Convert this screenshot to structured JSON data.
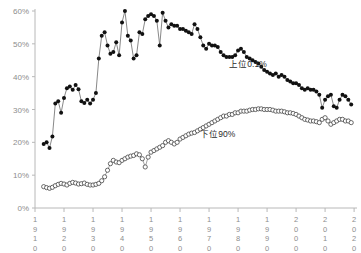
{
  "chart_data": {
    "type": "line",
    "title": "",
    "subtitle": "",
    "xlabel": "",
    "ylabel": "",
    "xlim": [
      1910,
      2021
    ],
    "ylim": [
      0,
      60
    ],
    "grid": false,
    "legend_position": "inline-annotations",
    "y_tick_labels": [
      "0%",
      "10%",
      "20%",
      "30%",
      "40%",
      "50%",
      "60%"
    ],
    "y_tick_values": [
      0,
      10,
      20,
      30,
      40,
      50,
      60
    ],
    "x_tick_labels": [
      "1910",
      "1920",
      "1930",
      "1940",
      "1950",
      "1960",
      "1970",
      "1980",
      "1990",
      "2000",
      "2010",
      "2020"
    ],
    "x_tick_values": [
      1910,
      1920,
      1930,
      1940,
      1950,
      1960,
      1970,
      1980,
      1990,
      2000,
      2010,
      2020
    ],
    "annotations": [
      {
        "name": "top-series-label",
        "text": "上位0.1%",
        "x": 1977,
        "y": 43
      },
      {
        "name": "bottom-series-label",
        "text": "下位90%",
        "x": 1967,
        "y": 21.5
      }
    ],
    "series": [
      {
        "name": "上位0.1%",
        "marker": "filled-circle",
        "color": "#111111",
        "x": [
          1913,
          1914,
          1915,
          1916,
          1917,
          1918,
          1919,
          1920,
          1921,
          1922,
          1923,
          1924,
          1925,
          1926,
          1927,
          1928,
          1929,
          1930,
          1931,
          1932,
          1933,
          1934,
          1935,
          1936,
          1937,
          1938,
          1939,
          1940,
          1941,
          1942,
          1943,
          1944,
          1945,
          1946,
          1947,
          1948,
          1949,
          1950,
          1951,
          1952,
          1953,
          1954,
          1955,
          1956,
          1957,
          1958,
          1959,
          1960,
          1961,
          1962,
          1963,
          1964,
          1965,
          1966,
          1967,
          1968,
          1969,
          1970,
          1971,
          1972,
          1973,
          1974,
          1975,
          1976,
          1977,
          1978,
          1979,
          1980,
          1981,
          1982,
          1983,
          1984,
          1985,
          1986,
          1987,
          1988,
          1989,
          1990,
          1991,
          1992,
          1993,
          1994,
          1995,
          1996,
          1997,
          1998,
          1999,
          2000,
          2001,
          2002,
          2003,
          2004,
          2005,
          2006,
          2007,
          2008,
          2009,
          2010,
          2011,
          2012,
          2013,
          2014,
          2015,
          2016,
          2017,
          2018,
          2019
        ],
        "values": [
          19.5,
          20.0,
          18.3,
          21.8,
          31.8,
          32.5,
          29.0,
          33.5,
          36.5,
          37.0,
          36.0,
          37.5,
          36.2,
          32.5,
          32.0,
          33.0,
          31.8,
          33.0,
          35.0,
          45.5,
          52.5,
          53.5,
          49.5,
          47.0,
          47.5,
          50.5,
          46.5,
          56.5,
          60.0,
          52.5,
          51.0,
          45.5,
          46.5,
          53.5,
          53.0,
          57.5,
          58.5,
          59.0,
          58.5,
          57.0,
          49.5,
          59.5,
          57.0,
          55.0,
          56.0,
          55.5,
          55.5,
          54.5,
          54.5,
          54.0,
          53.5,
          53.0,
          56.0,
          54.5,
          52.0,
          49.5,
          48.5,
          50.0,
          49.5,
          49.5,
          49.0,
          47.5,
          46.5,
          46.0,
          46.0,
          46.0,
          46.5,
          48.0,
          48.5,
          47.5,
          46.0,
          45.5,
          45.0,
          44.5,
          44.0,
          43.0,
          42.0,
          41.5,
          41.0,
          40.5,
          41.0,
          40.0,
          40.5,
          40.0,
          39.0,
          38.5,
          38.0,
          38.0,
          37.5,
          36.5,
          36.0,
          36.5,
          36.0,
          36.0,
          35.5,
          34.5,
          30.5,
          33.0,
          34.0,
          34.5,
          31.0,
          30.5,
          33.0,
          34.5,
          34.0,
          33.0,
          31.5
        ]
      },
      {
        "name": "下位90%",
        "marker": "open-circle",
        "color": "#ffffff",
        "x": [
          1913,
          1914,
          1915,
          1916,
          1917,
          1918,
          1919,
          1920,
          1921,
          1922,
          1923,
          1924,
          1925,
          1926,
          1927,
          1928,
          1929,
          1930,
          1931,
          1932,
          1933,
          1934,
          1935,
          1936,
          1937,
          1938,
          1939,
          1940,
          1941,
          1942,
          1943,
          1944,
          1945,
          1946,
          1947,
          1948,
          1949,
          1950,
          1951,
          1952,
          1953,
          1954,
          1955,
          1956,
          1957,
          1958,
          1959,
          1960,
          1961,
          1962,
          1963,
          1964,
          1965,
          1966,
          1967,
          1968,
          1969,
          1970,
          1971,
          1972,
          1973,
          1974,
          1975,
          1976,
          1977,
          1978,
          1979,
          1980,
          1981,
          1982,
          1983,
          1984,
          1985,
          1986,
          1987,
          1988,
          1989,
          1990,
          1991,
          1992,
          1993,
          1994,
          1995,
          1996,
          1997,
          1998,
          1999,
          2000,
          2001,
          2002,
          2003,
          2004,
          2005,
          2006,
          2007,
          2008,
          2009,
          2010,
          2011,
          2012,
          2013,
          2014,
          2015,
          2016,
          2017,
          2018,
          2019
        ],
        "values": [
          6.5,
          6.2,
          6.0,
          6.3,
          6.8,
          7.2,
          7.5,
          7.3,
          7.0,
          7.5,
          7.8,
          7.6,
          7.3,
          7.4,
          7.6,
          7.2,
          7.0,
          7.0,
          7.2,
          7.5,
          8.3,
          9.5,
          11.5,
          13.5,
          14.5,
          14.0,
          13.8,
          14.5,
          15.0,
          15.5,
          15.8,
          16.0,
          16.5,
          16.2,
          15.0,
          12.5,
          15.5,
          17.0,
          17.5,
          18.0,
          18.5,
          19.0,
          20.0,
          20.5,
          20.0,
          19.5,
          20.0,
          21.0,
          21.5,
          22.0,
          22.5,
          22.8,
          23.0,
          23.5,
          24.0,
          24.5,
          25.0,
          25.5,
          26.0,
          26.5,
          27.0,
          27.5,
          28.0,
          28.0,
          28.5,
          28.5,
          29.0,
          29.0,
          29.5,
          29.5,
          29.5,
          29.8,
          30.0,
          30.0,
          30.2,
          30.2,
          30.0,
          30.0,
          30.0,
          29.8,
          29.5,
          29.5,
          29.5,
          29.3,
          29.0,
          29.0,
          28.8,
          28.5,
          28.0,
          27.5,
          27.0,
          26.8,
          26.5,
          26.5,
          26.3,
          26.0,
          27.0,
          27.5,
          26.5,
          25.5,
          26.0,
          26.5,
          27.0,
          27.0,
          26.5,
          26.5,
          26.0
        ]
      }
    ]
  }
}
